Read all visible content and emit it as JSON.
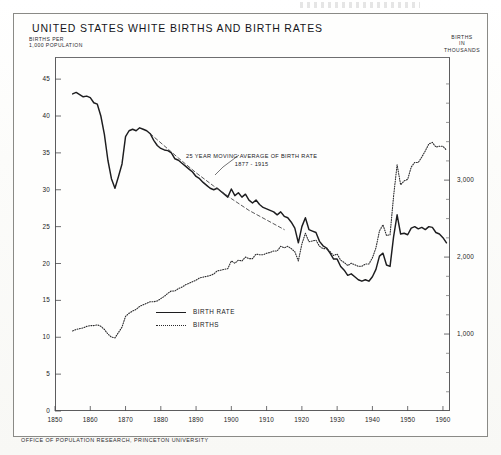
{
  "document": {
    "title": "UNITED STATES  WHITE  BIRTHS AND BIRTH RATES",
    "footer": "OFFICE OF POPULATION RESEARCH, PRINCETON UNIVERSITY"
  },
  "axis_labels": {
    "left_line1": "BIRTHS PER",
    "left_line2": "1,000 POPULATION",
    "right_line1": "BIRTHS",
    "right_line2": "IN",
    "right_line3": "THOUSANDS"
  },
  "annotation": {
    "line1": "25 YEAR MOVING AVERAGE OF BIRTH RATE",
    "line2": "1877 - 1915"
  },
  "legend": {
    "items": [
      {
        "label": "BIRTH RATE",
        "style": "solid"
      },
      {
        "label": "BIRTHS",
        "style": "dotted"
      }
    ]
  },
  "chart_data": {
    "type": "line",
    "title": "UNITED STATES  WHITE  BIRTHS AND BIRTH RATES",
    "xlabel": "",
    "ylabel": "BIRTHS PER 1,000 POPULATION",
    "ylabel_right": "BIRTHS IN THOUSANDS",
    "grid": false,
    "legend_position": "center-lower-left",
    "xlim": [
      1850,
      1962
    ],
    "ylim_left": [
      0,
      48
    ],
    "ylim_right": [
      0,
      4600
    ],
    "xticks": [
      1850,
      1860,
      1870,
      1880,
      1890,
      1900,
      1910,
      1920,
      1930,
      1940,
      1950,
      1960
    ],
    "xtick_labels": [
      "1850",
      "1860",
      "1870",
      "1880",
      "1890",
      "1900",
      "1910",
      "1920",
      "1930",
      "1940",
      "1950",
      "1960"
    ],
    "yticks_left": [
      0,
      5,
      10,
      15,
      20,
      25,
      30,
      35,
      40,
      45
    ],
    "ytick_labels_left": [
      "0",
      "5",
      "10",
      "15",
      "20",
      "25",
      "30",
      "35",
      "40",
      "45"
    ],
    "yticks_right": [
      1000,
      2000,
      3000
    ],
    "ytick_labels_right": [
      "1,000",
      "2,000",
      "3,000"
    ],
    "yticks_right_minor": [
      250,
      500,
      750,
      1250,
      1500,
      1750,
      2250,
      2500,
      2750,
      3250,
      3500,
      3750,
      4000,
      4250
    ],
    "series": [
      {
        "name": "BIRTH RATE",
        "style": "solid",
        "axis": "left",
        "units": "births per 1,000 population",
        "x": [
          1855,
          1856,
          1857,
          1858,
          1859,
          1860,
          1861,
          1862,
          1863,
          1864,
          1865,
          1866,
          1867,
          1868,
          1869,
          1870,
          1871,
          1872,
          1873,
          1874,
          1875,
          1876,
          1877,
          1878,
          1879,
          1880,
          1881,
          1882,
          1883,
          1884,
          1885,
          1886,
          1887,
          1888,
          1889,
          1890,
          1891,
          1892,
          1893,
          1894,
          1895,
          1896,
          1897,
          1898,
          1899,
          1900,
          1901,
          1902,
          1903,
          1904,
          1905,
          1906,
          1907,
          1908,
          1909,
          1910,
          1911,
          1912,
          1913,
          1914,
          1915,
          1916,
          1917,
          1918,
          1919,
          1920,
          1921,
          1922,
          1923,
          1924,
          1925,
          1926,
          1927,
          1928,
          1929,
          1930,
          1931,
          1932,
          1933,
          1934,
          1935,
          1936,
          1937,
          1938,
          1939,
          1940,
          1941,
          1942,
          1943,
          1944,
          1945,
          1946,
          1947,
          1948,
          1949,
          1950,
          1951,
          1952,
          1953,
          1954,
          1955,
          1956,
          1957,
          1958,
          1959,
          1960,
          1961
        ],
        "values": [
          43.0,
          43.2,
          42.9,
          42.6,
          42.7,
          42.5,
          41.8,
          41.6,
          40.0,
          37.5,
          34.0,
          31.5,
          30.2,
          31.8,
          33.5,
          37.2,
          38.0,
          38.2,
          38.0,
          38.4,
          38.2,
          38.0,
          37.6,
          36.7,
          36.0,
          35.6,
          35.4,
          35.3,
          35.0,
          34.2,
          34.0,
          33.6,
          33.2,
          32.8,
          32.4,
          31.8,
          31.5,
          31.0,
          30.6,
          30.2,
          30.0,
          30.2,
          29.8,
          29.4,
          29.0,
          30.1,
          29.2,
          29.6,
          29.0,
          29.4,
          28.6,
          28.2,
          28.6,
          28.0,
          27.6,
          27.4,
          27.2,
          27.0,
          26.6,
          27.0,
          26.4,
          26.2,
          25.6,
          24.8,
          22.8,
          25.0,
          26.2,
          24.6,
          24.4,
          24.2,
          23.0,
          22.4,
          22.1,
          21.4,
          20.6,
          20.6,
          19.6,
          19.1,
          18.4,
          18.6,
          18.2,
          17.8,
          17.6,
          17.8,
          17.6,
          18.2,
          19.2,
          21.0,
          21.4,
          19.8,
          19.6,
          23.6,
          26.6,
          24.0,
          24.1,
          23.9,
          24.8,
          25.0,
          24.7,
          24.9,
          24.6,
          25.0,
          24.9,
          24.2,
          24.0,
          23.5,
          22.8
        ],
        "notes": "Sharp Civil War trough c.1866-1867; long secular decline to 1933 Depression low of ~17.6; 1947 post-war peak ~26.6"
      },
      {
        "name": "BIRTHS",
        "style": "dotted",
        "axis": "right",
        "units": "thousands",
        "x": [
          1855,
          1856,
          1857,
          1858,
          1859,
          1860,
          1861,
          1862,
          1863,
          1864,
          1865,
          1866,
          1867,
          1868,
          1869,
          1870,
          1871,
          1872,
          1873,
          1874,
          1875,
          1876,
          1877,
          1878,
          1879,
          1880,
          1881,
          1882,
          1883,
          1884,
          1885,
          1886,
          1887,
          1888,
          1889,
          1890,
          1891,
          1892,
          1893,
          1894,
          1895,
          1896,
          1897,
          1898,
          1899,
          1900,
          1901,
          1902,
          1903,
          1904,
          1905,
          1906,
          1907,
          1908,
          1909,
          1910,
          1911,
          1912,
          1913,
          1914,
          1915,
          1916,
          1917,
          1918,
          1919,
          1920,
          1921,
          1922,
          1923,
          1924,
          1925,
          1926,
          1927,
          1928,
          1929,
          1930,
          1931,
          1932,
          1933,
          1934,
          1935,
          1936,
          1937,
          1938,
          1939,
          1940,
          1941,
          1942,
          1943,
          1944,
          1945,
          1946,
          1947,
          1948,
          1949,
          1950,
          1951,
          1952,
          1953,
          1954,
          1955,
          1956,
          1957,
          1958,
          1959,
          1960,
          1961
        ],
        "values": [
          1040,
          1060,
          1070,
          1080,
          1100,
          1110,
          1110,
          1120,
          1100,
          1060,
          1000,
          960,
          950,
          1020,
          1090,
          1230,
          1270,
          1300,
          1320,
          1360,
          1380,
          1400,
          1420,
          1420,
          1430,
          1460,
          1490,
          1530,
          1560,
          1560,
          1590,
          1610,
          1640,
          1660,
          1680,
          1700,
          1730,
          1740,
          1750,
          1760,
          1780,
          1820,
          1830,
          1840,
          1850,
          1950,
          1920,
          1960,
          1950,
          2000,
          1980,
          1980,
          2040,
          2030,
          2030,
          2050,
          2060,
          2080,
          2080,
          2140,
          2120,
          2140,
          2110,
          2070,
          1950,
          2170,
          2310,
          2200,
          2210,
          2220,
          2140,
          2110,
          2110,
          2070,
          2020,
          2040,
          1960,
          1930,
          1890,
          1920,
          1900,
          1880,
          1880,
          1910,
          1910,
          1990,
          2120,
          2340,
          2420,
          2280,
          2290,
          2790,
          3200,
          2940,
          2990,
          3010,
          3170,
          3230,
          3230,
          3300,
          3380,
          3470,
          3490,
          3430,
          3440,
          3440,
          3390
        ],
        "notes": "Right axis in thousands; rises through 19th century, Depression dip c.1933-1936, 1947 post-war spike and 1950s baby boom plateau ~3,400-3,500"
      },
      {
        "name": "25 YEAR MOVING AVERAGE OF BIRTH RATE 1877 - 1915",
        "style": "dashed",
        "axis": "left",
        "units": "births per 1,000 population",
        "x": [
          1877,
          1885,
          1890,
          1895,
          1900,
          1905,
          1910,
          1915
        ],
        "values": [
          37.6,
          34.3,
          32.3,
          30.5,
          28.8,
          27.2,
          25.9,
          24.6
        ],
        "notes": "Straight trend line superimposed on the birth-rate curve between 1877 and 1915"
      }
    ]
  }
}
